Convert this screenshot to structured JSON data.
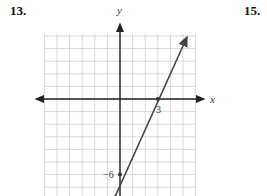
{
  "problems": {
    "left_number": "13.",
    "right_number": "15."
  },
  "chart_data": {
    "type": "line",
    "title": "",
    "xlabel": "x",
    "ylabel": "y",
    "xlim": [
      -6,
      6
    ],
    "ylim": [
      -7,
      5
    ],
    "grid": true,
    "series": [
      {
        "name": "line",
        "x": [
          0,
          3
        ],
        "y": [
          -6,
          0
        ]
      }
    ],
    "annotations": [
      {
        "x": 3,
        "y": 0,
        "label": "3"
      },
      {
        "x": 0,
        "y": -6,
        "label": "-6"
      }
    ],
    "colors": {
      "line": "#444444",
      "grid": "#cccccc",
      "axis": "#222222"
    }
  }
}
